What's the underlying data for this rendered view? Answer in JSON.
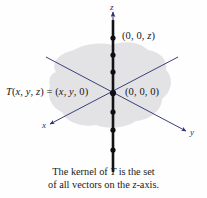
{
  "figure": {
    "kind": "math-diagram-3d-axes",
    "background_color": "#fefefe",
    "plane_blob_color": "#e3e3e5",
    "axis_color": "#2b2f7a",
    "kernel_axis_color": "#111114",
    "label_color": "#16161c"
  },
  "axes": [
    {
      "id": "x",
      "label": "x",
      "label_x": 42,
      "label_y": 126,
      "arrow": "down-left"
    },
    {
      "id": "y",
      "label": "y",
      "label_x": 190,
      "label_y": 133,
      "arrow": "down-right"
    },
    {
      "id": "z",
      "label": "z",
      "label_x": 110,
      "label_y": 4,
      "arrow": "up"
    }
  ],
  "points": [
    {
      "id": "point-on-z-axis",
      "label": "(0, 0, z)",
      "x": 122,
      "y": 36
    },
    {
      "id": "origin",
      "label": "(0, 0, 0)",
      "x": 124,
      "y": 87
    }
  ],
  "mapping_label": {
    "id": "transformation-rule",
    "text": "T(x, y, z)  =  (x, y, 0)",
    "x": 6,
    "y": 87
  },
  "kernel_dots_z": [
    38,
    55,
    72,
    93,
    112,
    130,
    150
  ],
  "kernel_axis_x": 113,
  "caption": {
    "line1": "The kernel of T is the set",
    "line2": "of all vectors on the z-axis."
  }
}
